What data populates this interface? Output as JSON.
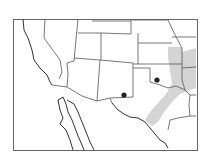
{
  "map": {
    "title": "",
    "region": "Southwestern and South-Central United States and northern Mexico",
    "colors": {
      "background": "#ffffff",
      "border": "#555555",
      "coast": "#333333",
      "range": "#cfcfcf",
      "marker": "#222222"
    },
    "shaded_range": {
      "description": "Gray shaded distribution band from eastern Kansas/Missouri south through Oklahoma into central Texas"
    },
    "markers": [
      {
        "label": "site-1",
        "x": 124,
        "y": 95
      },
      {
        "label": "site-2",
        "x": 157,
        "y": 80
      }
    ]
  }
}
